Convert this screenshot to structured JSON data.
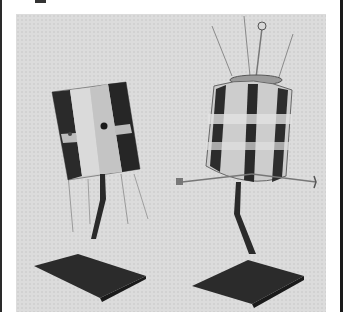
{
  "image": {
    "description": "Black-and-white photograph of two cylindrical satellite models mounted on angled display stands",
    "subjects": [
      {
        "name": "left-satellite-model",
        "shape": "faceted cylinder with dark solar panel stripes and trailing antennas"
      },
      {
        "name": "right-satellite-model",
        "shape": "cylinder with checkered solar panels, top whip antennas with ball tip, side boom arms"
      }
    ],
    "colors": {
      "background": "#dcdcdc",
      "frame": "#1a1a1a",
      "stand": "#2b2b2b",
      "panel_dark": "#222222",
      "panel_light": "#c8c8c8"
    }
  }
}
